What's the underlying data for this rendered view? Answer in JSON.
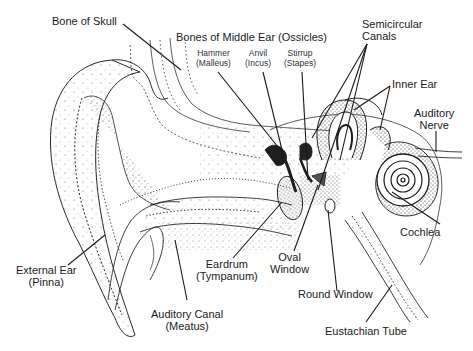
{
  "diagram": {
    "style": "black-and-white stipple illustration",
    "colors": {
      "ink": "#1c1c1c",
      "background": "#ffffff"
    },
    "labels": {
      "bone_of_skull": {
        "line1": "Bone of Skull"
      },
      "bones_middle_ear": {
        "line1": "Bones of Middle Ear (Ossicles)"
      },
      "hammer": {
        "line1": "Hammer",
        "line2": "(Malleus)"
      },
      "anvil": {
        "line1": "Anvil",
        "line2": "(Incus)"
      },
      "stirrup": {
        "line1": "Stirrup",
        "line2": "(Stapes)"
      },
      "semicircular_canals": {
        "line1": "Semicircular",
        "line2": "Canals"
      },
      "inner_ear": {
        "line1": "Inner Ear"
      },
      "auditory_nerve": {
        "line1": "Auditory",
        "line2": "Nerve"
      },
      "cochlea": {
        "line1": "Cochlea"
      },
      "eardrum": {
        "line1": "Eardrum",
        "line2": "(Tympanum)"
      },
      "oval_window": {
        "line1": "Oval",
        "line2": "Window"
      },
      "round_window": {
        "line1": "Round Window"
      },
      "external_ear": {
        "line1": "External Ear",
        "line2": "(Pinna)"
      },
      "auditory_canal": {
        "line1": "Auditory Canal",
        "line2": "(Meatus)"
      },
      "eustachian_tube": {
        "line1": "Eustachian Tube"
      }
    }
  }
}
